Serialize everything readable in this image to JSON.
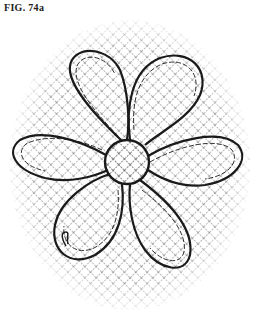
{
  "figure": {
    "label": "FIG. 74a",
    "petal_count": 5,
    "colors": {
      "background": "#ffffff",
      "line": "#1a1a1a",
      "hatch": "#555555"
    }
  }
}
